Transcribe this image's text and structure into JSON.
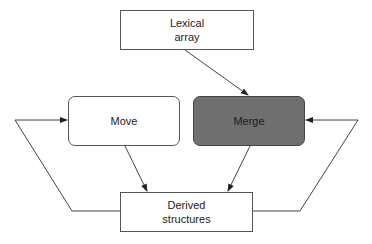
{
  "diagram": {
    "nodes": {
      "lexical_array": {
        "label_line1": "Lexical",
        "label_line2": "array"
      },
      "move": {
        "label": "Move"
      },
      "merge": {
        "label": "Merge",
        "fill": "#6f6f6f"
      },
      "derived_structures": {
        "label_line1": "Derived",
        "label_line2": "structures"
      }
    },
    "edges": [
      {
        "from": "Lexical array",
        "to": "Merge"
      },
      {
        "from": "Move",
        "to": "Derived structures"
      },
      {
        "from": "Merge",
        "to": "Derived structures"
      },
      {
        "from": "Derived structures",
        "to": "Move",
        "route": "left feedback loop"
      },
      {
        "from": "Derived structures",
        "to": "Merge",
        "route": "right feedback loop"
      }
    ],
    "colors": {
      "line": "#444444",
      "merge_fill": "#6f6f6f",
      "box_border": "#555555"
    }
  }
}
